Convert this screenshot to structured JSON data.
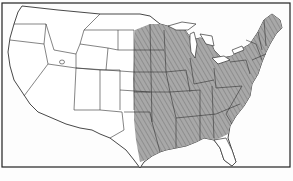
{
  "map": {
    "subject": "Contiguous United States with state boundaries",
    "shaded_region": "Eastern United States, from the Great Plains (eastern Dakotas, Nebraska, Kansas, Oklahoma, east Texas) to the Atlantic coast, excluding southern Florida",
    "colors": {
      "background": "#fdfdfd",
      "border": "#222222",
      "state_lines": "#333333",
      "shading": "#9a9a9a",
      "shading_light": "#bdbdbd"
    },
    "caption": ""
  }
}
